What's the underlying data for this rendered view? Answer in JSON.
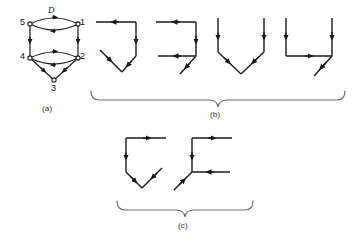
{
  "figure": {
    "panels": [
      {
        "key": "a",
        "caption": "(a)",
        "kind": "directed-graph",
        "edge_label": "D",
        "nodes": [
          {
            "id": "1",
            "label": "1"
          },
          {
            "id": "2",
            "label": "2"
          },
          {
            "id": "3",
            "label": "3"
          },
          {
            "id": "4",
            "label": "4"
          },
          {
            "id": "5",
            "label": "5"
          }
        ],
        "node_labels": [
          "5",
          "1",
          "4",
          "2",
          "3"
        ]
      },
      {
        "key": "b",
        "caption": "(b)",
        "kind": "subgraph-row",
        "count": 4,
        "shapes": [
          "hook-right-down",
          "bracket-c-right",
          "vee-down",
          "u-up-with-tail"
        ]
      },
      {
        "key": "c",
        "caption": "(c)",
        "kind": "subgraph-row",
        "count": 2,
        "shapes": [
          "hook-left-down",
          "bracket-e-left"
        ]
      }
    ],
    "colors": {
      "ink": "#1a1a1a",
      "brace": "#6b6b6b",
      "background": "#ffffff"
    }
  }
}
